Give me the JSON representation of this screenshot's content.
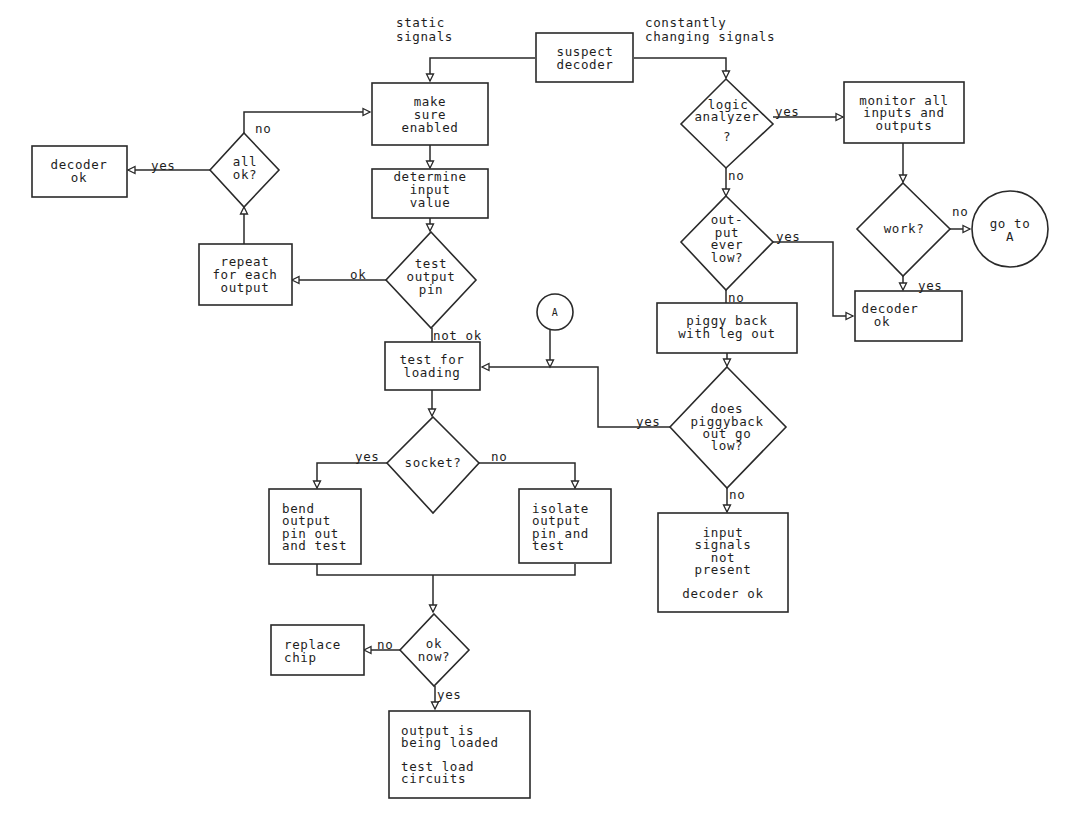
{
  "title_labels": {
    "static": [
      "static",
      "signals"
    ],
    "changing": [
      "constantly",
      "changing signals"
    ]
  },
  "nodes": {
    "suspect_decoder": [
      "suspect",
      "decoder"
    ],
    "make_sure_enabled": [
      "make",
      "sure",
      "enabled"
    ],
    "determine_input": [
      "determine",
      "input",
      "value"
    ],
    "test_output_pin": [
      "test",
      "output",
      "pin"
    ],
    "repeat_each": [
      "repeat",
      "for each",
      "output"
    ],
    "all_ok": [
      "all",
      "ok?"
    ],
    "decoder_ok_left": [
      "decoder",
      "ok"
    ],
    "logic_analyzer": [
      "logic",
      "analyzer",
      "?"
    ],
    "monitor_all": [
      "monitor all",
      "inputs and",
      "outputs"
    ],
    "work": [
      "work?"
    ],
    "go_to_a": [
      "go to",
      "A"
    ],
    "output_ever_low": [
      "out-",
      "put",
      "ever",
      "low?"
    ],
    "decoder_ok_right": [
      "decoder",
      "ok"
    ],
    "piggy_back": [
      "piggy back",
      "with leg out"
    ],
    "connector_a": [
      "A"
    ],
    "test_for_loading": [
      "test for",
      "loading"
    ],
    "does_piggyback": [
      "does",
      "piggyback",
      "out go",
      "low?"
    ],
    "socket": [
      "socket?"
    ],
    "bend_output": [
      "bend",
      "output",
      "pin out",
      "and test"
    ],
    "isolate_output": [
      "isolate",
      "output",
      "pin and",
      "test"
    ],
    "input_signals": [
      "input",
      "signals",
      "not",
      "present",
      "",
      "decoder ok"
    ],
    "ok_now": [
      "ok",
      "now?"
    ],
    "replace_chip": [
      "replace",
      "chip"
    ],
    "output_loaded": [
      "output is",
      "being loaded",
      "",
      "test load",
      "circuits"
    ]
  },
  "edge_labels": {
    "all_ok_no": "no",
    "all_ok_yes": "yes",
    "test_pin_ok": "ok",
    "test_pin_not_ok": "not ok",
    "logic_yes": "yes",
    "logic_no": "no",
    "work_no": "no",
    "work_yes": "yes",
    "ever_low_yes": "yes",
    "ever_low_no": "no",
    "piggyback_yes": "yes",
    "piggyback_no": "no",
    "socket_yes": "yes",
    "socket_no": "no",
    "ok_now_no": "no",
    "ok_now_yes": "yes"
  }
}
